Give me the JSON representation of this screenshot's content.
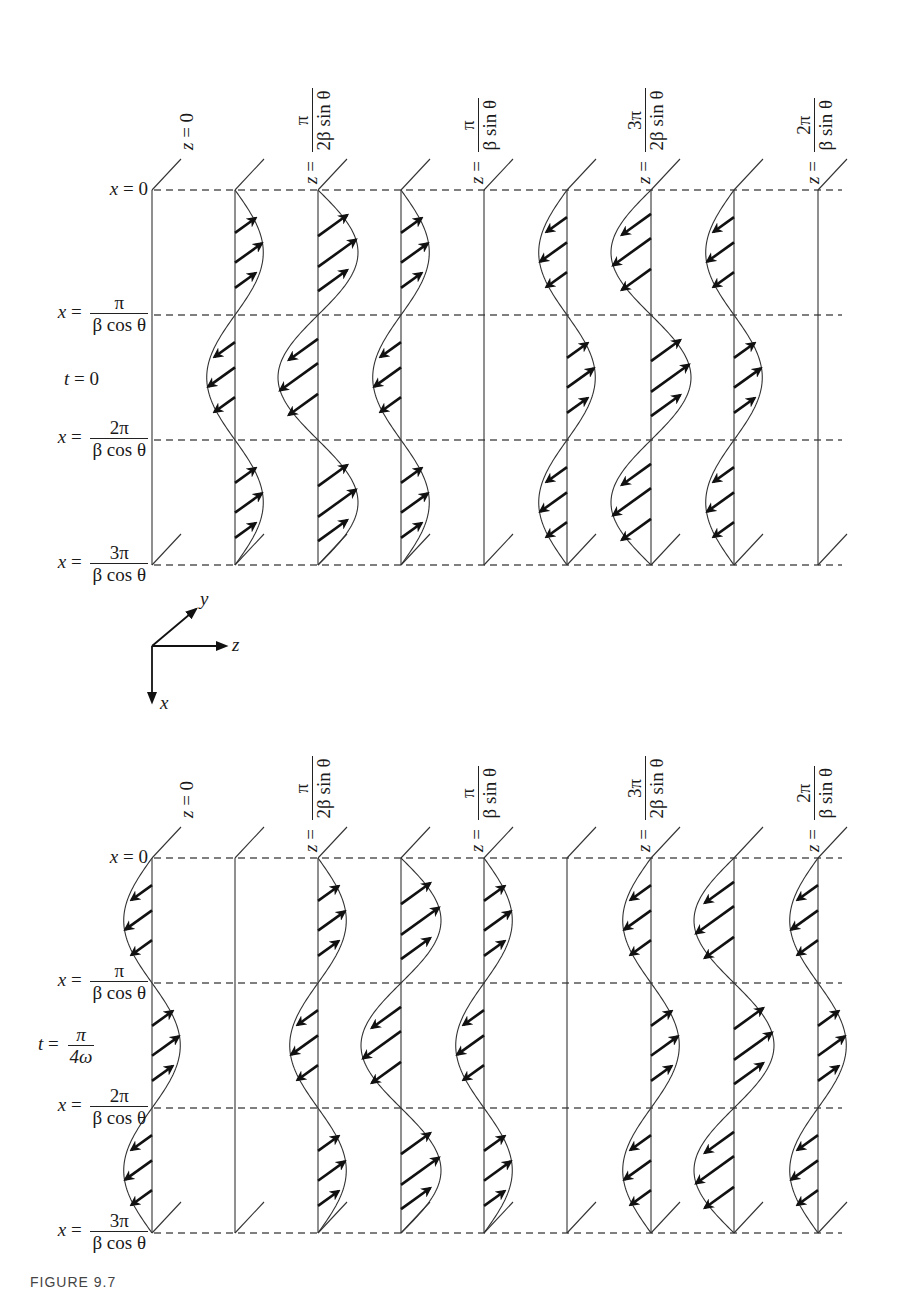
{
  "figure": {
    "caption": "FIGURE 9.7",
    "colors": {
      "line": "#333333",
      "arrow": "#111111",
      "dash": "#555555",
      "background": "#ffffff"
    }
  },
  "axes_indicator": {
    "x_label": "x",
    "y_label": "y",
    "z_label": "z"
  },
  "z_labels": [
    {
      "var": "z",
      "eq": "=",
      "num": "0",
      "den": "",
      "column": 0
    },
    {
      "var": "z",
      "eq": "=",
      "num": "π",
      "den": "2β sin θ",
      "column": 2
    },
    {
      "var": "z",
      "eq": "=",
      "num": "π",
      "den": "β sin θ",
      "column": 4
    },
    {
      "var": "z",
      "eq": "=",
      "num": "3π",
      "den": "2β sin θ",
      "column": 6
    },
    {
      "var": "z",
      "eq": "=",
      "num": "2π",
      "den": "β sin θ",
      "column": 8
    }
  ],
  "x_labels": [
    {
      "var": "x",
      "eq": "=",
      "num": "0",
      "den": ""
    },
    {
      "var": "x",
      "eq": "=",
      "num": "π",
      "den": "β cos θ"
    },
    {
      "var": "x",
      "eq": "=",
      "num": "2π",
      "den": "β cos θ"
    },
    {
      "var": "x",
      "eq": "=",
      "num": "3π",
      "den": "β cos θ"
    }
  ],
  "panels": [
    {
      "name": "t0",
      "time_label": {
        "var": "t",
        "eq": "=",
        "num": "0",
        "den": ""
      },
      "top_y": 190,
      "amplitudes": [
        0,
        0.707,
        1,
        0.707,
        0,
        -0.707,
        -1,
        -0.707,
        0
      ]
    },
    {
      "name": "t-pi-over-4omega",
      "time_label": {
        "var": "t",
        "eq": "=",
        "num": "π",
        "den": "4ω"
      },
      "top_y": 858,
      "amplitudes": [
        -0.707,
        0,
        0.707,
        1,
        0.707,
        0,
        -0.707,
        -1,
        -0.707
      ]
    }
  ],
  "geometry": {
    "column_x": [
      152,
      235,
      318,
      401,
      484,
      567,
      651,
      734,
      818
    ],
    "half_period_px": 125,
    "half_periods": 3,
    "max_amplitude_px": 40,
    "dash_end_x": 842
  }
}
